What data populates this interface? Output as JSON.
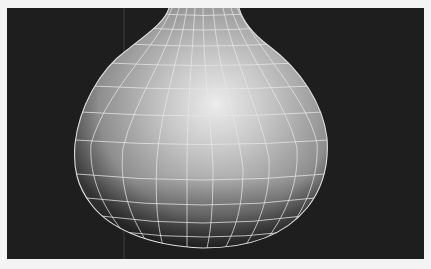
{
  "viewport": {
    "label": "3D perspective viewport",
    "background_color": "#1e1e1e",
    "frame_color": "#f4f4f4",
    "mode": "smooth shaded + wireframe on shaded"
  },
  "model": {
    "name": "vase",
    "shape": "gourd / bulb vase with narrow neck",
    "surface_color": "#bdbdbd",
    "highlight_color": "#ececec",
    "wire_color": "#e6e6e6",
    "grid_rows": 11,
    "grid_columns": 13
  },
  "overlay": {
    "axis_line_color": "#4a4a4a"
  }
}
